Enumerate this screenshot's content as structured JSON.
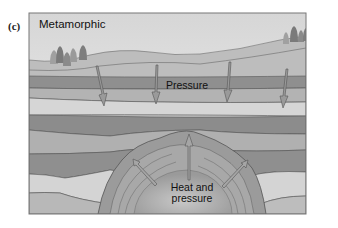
{
  "panel": {
    "label": "(c)",
    "title": "Metamorphic"
  },
  "labels": {
    "pressure": "Pressure",
    "heat_line1": "Heat and",
    "heat_line2": "pressure"
  },
  "colors": {
    "sky_top": "#d8d8d8",
    "sky_bottom": "#f0f0f0",
    "hill": "#b9b9b9",
    "layer_light": "#cfcfcf",
    "layer_mid": "#b0b0b0",
    "layer_dark": "#8f8f8f",
    "intrusion": "#999999",
    "frame": "#777777"
  },
  "arrows": {
    "pressure_down_count": 5,
    "heat_outward_count": 3
  }
}
